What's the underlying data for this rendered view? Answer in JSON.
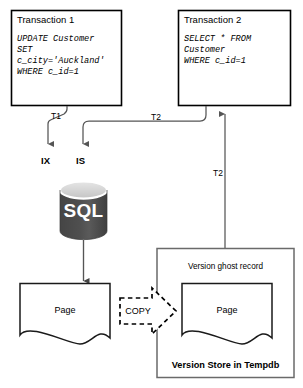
{
  "diagram": {
    "header_fragment": "",
    "transaction1": {
      "title": "Transaction 1",
      "sql": "UPDATE Customer\nSET\nc_city='Auckland'\nWHERE c_id=1"
    },
    "transaction2": {
      "title": "Transaction 2",
      "sql": "SELECT * FROM\nCustomer\nWHERE c_id=1"
    },
    "edges": {
      "t1_lock": "T1",
      "t2_lock": "T2",
      "t2_version": "T2"
    },
    "locks": {
      "intent_exclusive": "IX",
      "intent_shared": "IS"
    },
    "database": {
      "label": "SQL"
    },
    "pages": {
      "source": "Page",
      "version": "Page"
    },
    "copy_arrow": {
      "label": "COPY"
    },
    "version_store": {
      "ghost_record": "Version ghost record",
      "title": "Version Store in Tempdb"
    },
    "colors": {
      "stroke": "#000000",
      "connector": "#555555",
      "store_border": "#666666",
      "db_body": "#4d4d4d",
      "db_top": "#d9d9d9",
      "db_top_stroke": "#ffffff",
      "background": "#ffffff"
    }
  }
}
